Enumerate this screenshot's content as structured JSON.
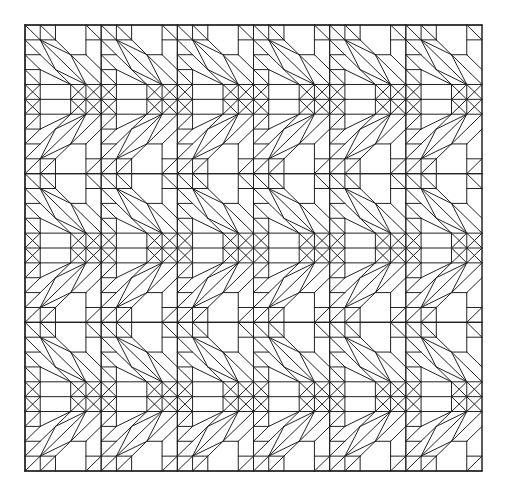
{
  "figure": {
    "width": 512,
    "height": 500,
    "background": "#ffffff",
    "stroke_color": "#222222",
    "stroke_width": 1,
    "frame": {
      "x0": 25,
      "y0": 25,
      "x1": 482,
      "y1": 471
    },
    "grid": {
      "cols": 30,
      "rows": 30
    },
    "tile": {
      "cols": 5,
      "rows": 10,
      "description": "Top half (rows 0-5) is a down-right diagonal band with diamonds; bottom half mirrors it vertically; chevron arrows at the band seams",
      "top_half_segments": [
        [
          0,
          0,
          5,
          0
        ],
        [
          0,
          0,
          0,
          5
        ],
        [
          1,
          0,
          1,
          1
        ],
        [
          2,
          0,
          2,
          1
        ],
        [
          4,
          0,
          4,
          2
        ],
        [
          0,
          1,
          2,
          1
        ],
        [
          4,
          1,
          5,
          1
        ],
        [
          3,
          2,
          4,
          2
        ],
        [
          0,
          2,
          1,
          2
        ],
        [
          1,
          3,
          1,
          5
        ],
        [
          3,
          4,
          3,
          5
        ],
        [
          4,
          4,
          4,
          5
        ],
        [
          0,
          4,
          5,
          4
        ],
        [
          0,
          3,
          1,
          3
        ],
        [
          0,
          0,
          1,
          1
        ],
        [
          1,
          0,
          2,
          1
        ],
        [
          4,
          0,
          5,
          1
        ],
        [
          1,
          1,
          4,
          4
        ],
        [
          1,
          1,
          3,
          2
        ],
        [
          3,
          2,
          4,
          4
        ],
        [
          1,
          1,
          2,
          3
        ],
        [
          2,
          3,
          4,
          4
        ],
        [
          2,
          1,
          5,
          4
        ],
        [
          0,
          1,
          3,
          4
        ],
        [
          0,
          2,
          1,
          3
        ],
        [
          1,
          3,
          3,
          4
        ],
        [
          0,
          4,
          1,
          5
        ],
        [
          0,
          5,
          1,
          4
        ],
        [
          3,
          4,
          4,
          5
        ],
        [
          4,
          4,
          5,
          5
        ],
        [
          3,
          5,
          4,
          4
        ],
        [
          4,
          5,
          5,
          4
        ],
        [
          0,
          3,
          1,
          4
        ],
        [
          4,
          2,
          5,
          3
        ]
      ]
    }
  }
}
